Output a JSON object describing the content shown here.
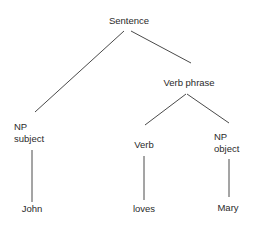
{
  "diagram": {
    "type": "parse-tree",
    "nodes": {
      "sentence": {
        "label": "Sentence"
      },
      "verb_phrase": {
        "label": "Verb phrase"
      },
      "np_subject": {
        "line1": "NP",
        "line2": "subject"
      },
      "verb": {
        "label": "Verb"
      },
      "np_object": {
        "line1": "NP",
        "line2": "object"
      },
      "john": {
        "label": "John"
      },
      "loves": {
        "label": "loves"
      },
      "mary": {
        "label": "Mary"
      }
    },
    "edges": [
      {
        "from": "Sentence",
        "to": "NP subject"
      },
      {
        "from": "Sentence",
        "to": "Verb phrase"
      },
      {
        "from": "Verb phrase",
        "to": "Verb"
      },
      {
        "from": "Verb phrase",
        "to": "NP object"
      },
      {
        "from": "NP subject",
        "to": "John"
      },
      {
        "from": "Verb",
        "to": "loves"
      },
      {
        "from": "NP object",
        "to": "Mary"
      }
    ]
  }
}
